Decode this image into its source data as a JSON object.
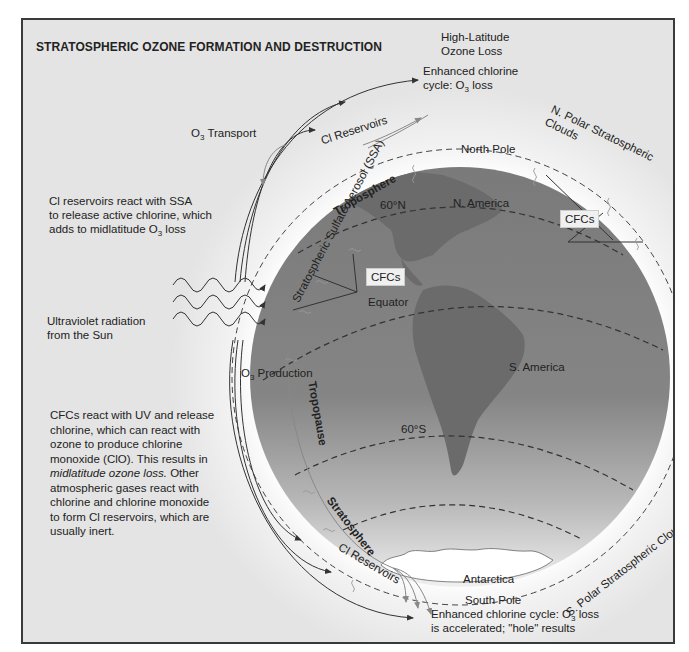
{
  "title": "STRATOSPHERIC OZONE FORMATION AND DESTRUCTION",
  "colors": {
    "background": "#e4e4e4",
    "frame": "#3a3a3a",
    "globe_dark": "#7e7e7e",
    "globe_light": "#d8d8d8",
    "halo": "#f6f6f6",
    "continent": "#6e6e6e",
    "antarctica": "#ffffff"
  },
  "labels": {
    "high_latitude": {
      "line1": "High-Latitude",
      "line2": "Ozone Loss"
    },
    "enhanced_top": {
      "line1": "Enhanced  chlorine",
      "line2_pre": "cycle: O",
      "line2_sub": "3",
      "line2_post": " loss"
    },
    "o3_transport": {
      "pre": "O",
      "sub": "3",
      "post": " Transport"
    },
    "cl_reservoirs_top": "Cl Reservoirs",
    "n_polar_clouds": "N. Polar Stratospheric Clouds",
    "north_pole": "North Pole",
    "troposphere": "Troposphere",
    "ssa": "Stratospheric Sulfate Aerosol (SSA)",
    "lat_60n": "60°N",
    "n_america": "N. America",
    "cfcs_left": "CFCs",
    "cfcs_right": "CFCs",
    "equator": "Equator",
    "s_america": "S. America",
    "lat_60s": "60°S",
    "tropopause": "Tropopause",
    "o3_production": {
      "pre": "O",
      "sub": "3",
      "post": " Production"
    },
    "uv": {
      "line1": "Ultraviolet radiation",
      "line2": "from the Sun"
    },
    "stratosphere": "Stratosphere",
    "cl_reservoirs_bottom": "Cl Reservoirs",
    "antarctica": "Antarctica",
    "south_pole": "South Pole",
    "s_polar_clouds": "S. Polar Stratospheric Clouds",
    "enhanced_bottom": {
      "line1_pre": "Enhanced chlorine cycle: O",
      "line1_sub": "3",
      "line1_post": " loss",
      "line2": "is accelerated; \"hole\" results"
    }
  },
  "notes": {
    "cl_ssa": {
      "line1": "Cl reservoirs react with SSA",
      "line2": "to release active chlorine, which",
      "line3_pre": "adds to midlatitude O",
      "line3_sub": "3",
      "line3_post": " loss"
    },
    "cfc": {
      "line1": "CFCs react with UV and release",
      "line2": "chlorine, which can react with",
      "line3": "ozone to produce chlorine",
      "line4": "monoxide (ClO).  This results in",
      "line5_italic": "midlatitude ozone loss.",
      "line5_post": "  Other",
      "line6": "atmospheric gases react with",
      "line7": "chlorine and chlorine monoxide",
      "line8": "to form Cl reservoirs, which are",
      "line9": "usually inert."
    }
  }
}
